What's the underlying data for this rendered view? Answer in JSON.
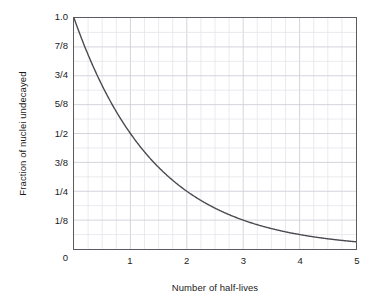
{
  "chart_data": {
    "type": "line",
    "title": "",
    "xlabel": "Number of half-lives",
    "ylabel": "Fraction of nuclei undecayed",
    "xlim": [
      0,
      5
    ],
    "ylim": [
      0,
      1
    ],
    "grid": true,
    "legend": "none",
    "x_ticks": [
      {
        "value": 0,
        "label": "0"
      },
      {
        "value": 1,
        "label": "1"
      },
      {
        "value": 2,
        "label": "2"
      },
      {
        "value": 3,
        "label": "3"
      },
      {
        "value": 4,
        "label": "4"
      },
      {
        "value": 5,
        "label": "5"
      }
    ],
    "y_ticks": [
      {
        "value": 1.0,
        "label": "1.0"
      },
      {
        "value": 0.875,
        "label": "7/8"
      },
      {
        "value": 0.75,
        "label": "3/4"
      },
      {
        "value": 0.625,
        "label": "5/8"
      },
      {
        "value": 0.5,
        "label": "1/2"
      },
      {
        "value": 0.375,
        "label": "3/8"
      },
      {
        "value": 0.25,
        "label": "1/4"
      },
      {
        "value": 0.125,
        "label": "1/8"
      },
      {
        "value": 0.0,
        "label": "0"
      }
    ],
    "series": [
      {
        "name": "Fraction undecayed",
        "formula": "y = 2^(-x)",
        "color": "#4a4a50",
        "x": [
          0,
          0.25,
          0.5,
          0.75,
          1,
          1.25,
          1.5,
          1.75,
          2,
          2.25,
          2.5,
          2.75,
          3,
          3.25,
          3.5,
          3.75,
          4,
          4.25,
          4.5,
          4.75,
          5
        ],
        "values": [
          1.0,
          0.841,
          0.707,
          0.595,
          0.5,
          0.42,
          0.354,
          0.297,
          0.25,
          0.21,
          0.177,
          0.149,
          0.125,
          0.105,
          0.088,
          0.074,
          0.0625,
          0.053,
          0.044,
          0.037,
          0.031
        ]
      }
    ],
    "grid_minor_x_divisions": 20,
    "grid_minor_y_divisions": 16,
    "colors": {
      "axis": "#5a5a60",
      "grid_minor": "#e2e2e8",
      "grid_major": "#cfcfd8",
      "curve": "#4a4a50",
      "text": "#1a1a1a",
      "background": "#ffffff"
    }
  }
}
